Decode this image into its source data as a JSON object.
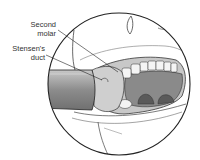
{
  "figure": {
    "type": "anatomical-illustration",
    "labels": [
      {
        "id": "second-molar",
        "lines": [
          "Second",
          "molar"
        ]
      },
      {
        "id": "stensens-duct",
        "lines": [
          "Stensen's",
          "duct"
        ]
      }
    ]
  },
  "colors": {
    "outline": "#222222",
    "tongue_palate": "#8a8a8a",
    "throat_dark": "#5a5a5a",
    "retractor": "#9a9a9a",
    "cheek_mucosa": "#c8c8c8",
    "teeth": "#f4f4f4",
    "skin": "#ffffff"
  }
}
